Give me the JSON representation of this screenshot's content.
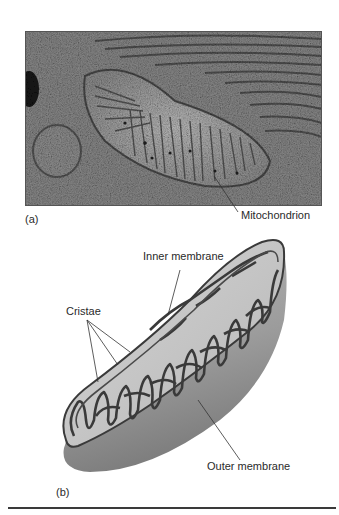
{
  "figure": {
    "panel_a": {
      "label": "(a)",
      "type": "electron micrograph",
      "callouts": [
        {
          "text": "Mitochondrion"
        }
      ]
    },
    "panel_b": {
      "label": "(b)",
      "type": "cutaway illustration",
      "callouts": [
        {
          "text": "Inner membrane"
        },
        {
          "text": "Cristae"
        },
        {
          "text": "Outer membrane"
        }
      ]
    },
    "colors": {
      "background": "#ffffff",
      "micrograph_dark": "#3d3d3d",
      "micrograph_light": "#a8a8a8",
      "membrane_stroke": "#3a3a3a",
      "outer_body": "#9a9a9a",
      "matrix_fill": "#c9c9c9",
      "rule": "#3a3a3a"
    }
  }
}
